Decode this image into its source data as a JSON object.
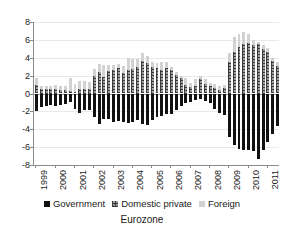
{
  "chart_data": {
    "type": "bar",
    "title": "Eurozone",
    "subtitle": "",
    "xlabel": "",
    "ylabel": "",
    "stacked": true,
    "grid": true,
    "legend_position": "bottom",
    "ylim": [
      -8,
      8
    ],
    "yticks": [
      8,
      6,
      4,
      2,
      0,
      -2,
      -4,
      -6,
      -8
    ],
    "ytick_labels": [
      "8",
      "6",
      "4",
      "2",
      "0",
      "-2",
      "-4",
      "-6",
      "-8"
    ],
    "xtick_labels": [
      "1999",
      "2000",
      "2001",
      "2002",
      "2003",
      "2004",
      "2005",
      "2006",
      "2007",
      "2008",
      "2009",
      "2010",
      "2011"
    ],
    "x": [
      "1999Q1",
      "1999Q2",
      "1999Q3",
      "1999Q4",
      "2000Q1",
      "2000Q2",
      "2000Q3",
      "2000Q4",
      "2001Q1",
      "2001Q2",
      "2001Q3",
      "2001Q4",
      "2002Q1",
      "2002Q2",
      "2002Q3",
      "2002Q4",
      "2003Q1",
      "2003Q2",
      "2003Q3",
      "2003Q4",
      "2004Q1",
      "2004Q2",
      "2004Q3",
      "2004Q4",
      "2005Q1",
      "2005Q2",
      "2005Q3",
      "2005Q4",
      "2006Q1",
      "2006Q2",
      "2006Q3",
      "2006Q4",
      "2007Q1",
      "2007Q2",
      "2007Q3",
      "2007Q4",
      "2008Q1",
      "2008Q2",
      "2008Q3",
      "2008Q4",
      "2009Q1",
      "2009Q2",
      "2009Q3",
      "2009Q4",
      "2010Q1",
      "2010Q2",
      "2010Q3",
      "2010Q4",
      "2011Q1",
      "2011Q2",
      "2011Q3"
    ],
    "series": [
      {
        "name": "Government",
        "color": "#111111",
        "pattern": "solid",
        "values": [
          -2.0,
          -1.5,
          -1.4,
          -1.3,
          -1.4,
          -1.3,
          -1.2,
          -1.0,
          -1.7,
          -2.2,
          -1.9,
          -1.8,
          -2.6,
          -3.4,
          -2.9,
          -2.9,
          -3.2,
          -3.1,
          -3.2,
          -3.3,
          -3.2,
          -3.0,
          -3.4,
          -3.5,
          -3.0,
          -2.6,
          -2.5,
          -2.3,
          -2.3,
          -1.8,
          -1.4,
          -1.1,
          -1.0,
          -0.7,
          -0.6,
          -0.8,
          -1.1,
          -1.7,
          -2.2,
          -2.4,
          -4.9,
          -5.8,
          -6.2,
          -6.3,
          -6.3,
          -6.4,
          -7.3,
          -6.3,
          -5.4,
          -4.5,
          -3.6
        ]
      },
      {
        "name": "Domestic private",
        "color": "#9e9e9e",
        "pattern": "checkered",
        "values": [
          0.9,
          0.5,
          0.5,
          0.5,
          0.5,
          0.4,
          0.4,
          0.3,
          0.2,
          0.5,
          0.5,
          0.5,
          2.0,
          2.4,
          1.9,
          2.5,
          2.6,
          2.8,
          2.3,
          2.6,
          2.7,
          3.0,
          3.6,
          3.4,
          3.0,
          2.9,
          2.6,
          2.9,
          2.6,
          2.1,
          1.7,
          1.0,
          0.7,
          0.8,
          1.6,
          1.1,
          0.8,
          0.6,
          0.4,
          0.6,
          3.5,
          4.6,
          5.2,
          5.5,
          5.6,
          5.4,
          5.5,
          5.0,
          4.6,
          3.6,
          3.1
        ]
      },
      {
        "name": "Foreign",
        "color": "#d2d2d2",
        "pattern": "solid-light",
        "values": [
          0.8,
          0.3,
          0.3,
          0.3,
          0.4,
          0.4,
          0.4,
          1.4,
          0.9,
          0.9,
          0.9,
          0.8,
          0.7,
          0.9,
          1.3,
          0.7,
          0.6,
          0.5,
          0.8,
          1.4,
          1.2,
          0.9,
          0.9,
          0.8,
          0.5,
          0.5,
          0.9,
          0.6,
          0.4,
          0.3,
          0.3,
          0.7,
          0.5,
          0.8,
          0.4,
          0.5,
          0.4,
          0.5,
          0.4,
          0.3,
          1.0,
          1.7,
          1.5,
          1.4,
          1.1,
          0.6,
          0.3,
          0.4,
          0.5,
          0.4,
          0.4
        ]
      }
    ]
  },
  "legend": {
    "items": [
      {
        "label": "Government"
      },
      {
        "label": "Domestic private"
      },
      {
        "label": "Foreign"
      }
    ]
  }
}
